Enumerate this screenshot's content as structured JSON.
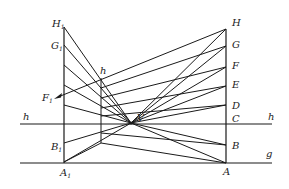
{
  "diagram": {
    "type": "perspective-construction",
    "labels": {
      "right_points": [
        "H",
        "G",
        "F",
        "E",
        "D",
        "C",
        "B",
        "A"
      ],
      "left_points": {
        "H1": "H",
        "G1": "G",
        "B1": "B",
        "A1": "A"
      },
      "subscript": "1",
      "vanishing_point": "V",
      "horizon_left": "h",
      "horizon_right": "h",
      "middle_h": "h",
      "ground": "g",
      "F1": "F",
      "F1_sub": "1"
    },
    "colors": {
      "line": "#1a1a1a",
      "background": "#ffffff",
      "text": "#222222"
    }
  }
}
